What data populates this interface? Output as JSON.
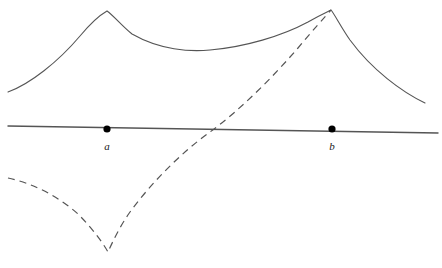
{
  "figure": {
    "name": "cusp-curves-on-line-diagram",
    "width": 442,
    "height": 268,
    "background_color": "#ffffff",
    "curve_color": "#555555",
    "axis_color": "#555555",
    "marker_color": "#000000",
    "label_color": "#1a1a1a"
  },
  "axis": {
    "name": "horizontal-line",
    "stroke_width": 1.4,
    "start": [
      8,
      126
    ],
    "end": [
      438,
      133
    ]
  },
  "points": [
    {
      "id": "point-a",
      "label": "a",
      "x": 107,
      "y": 129,
      "radius": 3.6,
      "label_x": 107,
      "label_y": 150
    },
    {
      "id": "point-b",
      "label": "b",
      "x": 332,
      "y": 129,
      "radius": 3.6,
      "label_x": 332,
      "label_y": 150
    }
  ],
  "curves": [
    {
      "id": "solid-curve",
      "style": "solid",
      "stroke_width": 1.1,
      "dash_pattern": "",
      "description": "upper curve with two upward cusps above a and b, concave dip between them, tails falling to both sides",
      "path": "M 8,92 C 30,84 58,62 80,36 C 90,24 100,15 107,11 C 114,16 122,26 132,34 C 160,50 190,52 210,50 C 245,47 282,36 308,22 C 320,15 327,12 331,10 C 335,15 341,27 350,40 C 372,70 402,92 425,103"
    },
    {
      "id": "dashed-curve",
      "style": "dashed",
      "stroke_width": 1.2,
      "dash_pattern": "7 5",
      "description": "lower-left branch falling to a downward cusp below a, then rising steeply through the line to meet the right peak above b",
      "path": "M 8,178 C 32,183 58,196 78,214 C 92,228 103,243 108,252 C 113,241 120,226 130,212 C 152,182 182,152 210,132 C 240,110 272,78 298,48 C 312,31 325,17 331,10"
    }
  ]
}
